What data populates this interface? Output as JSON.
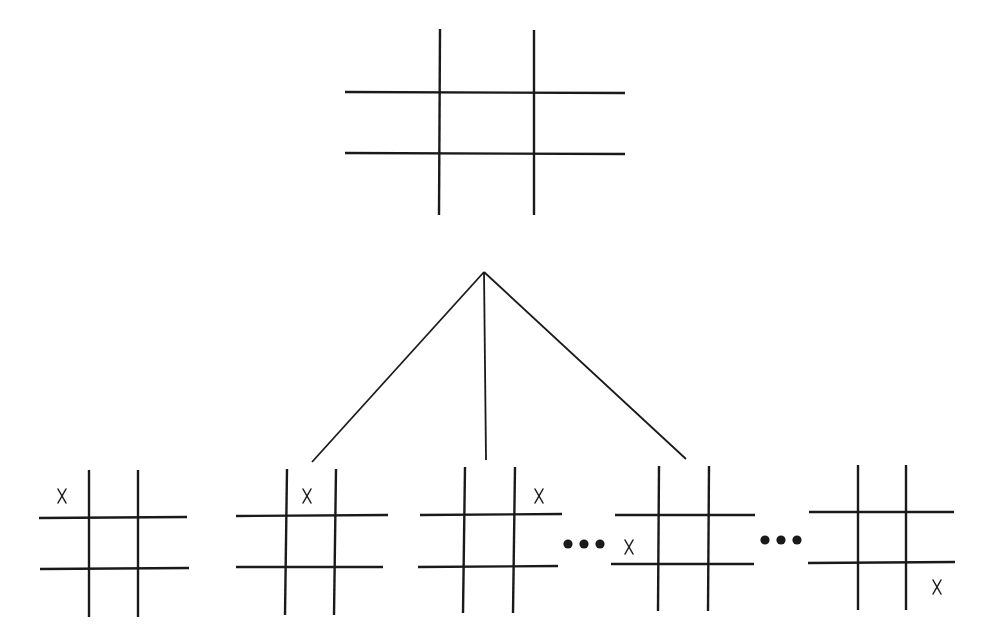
{
  "title": "Tic-tac-toe game tree: first move by X",
  "root": {
    "name": "empty-board",
    "vlines": [
      {
        "x1": 440,
        "y1": 29,
        "x2": 439,
        "y2": 215
      },
      {
        "x1": 534,
        "y1": 30,
        "x2": 534,
        "y2": 215
      }
    ],
    "hlines": [
      {
        "x1": 345,
        "y1": 92,
        "x2": 625,
        "y2": 93
      },
      {
        "x1": 345,
        "y1": 153,
        "x2": 625,
        "y2": 154
      }
    ],
    "marks": []
  },
  "branches": {
    "apex": {
      "x": 484,
      "y": 272
    },
    "ends": [
      {
        "x": 312,
        "y": 462
      },
      {
        "x": 486,
        "y": 460
      },
      {
        "x": 686,
        "y": 459
      }
    ]
  },
  "children": [
    {
      "name": "child-board-x-top-left",
      "cell": "top-left",
      "mark_label": "X",
      "vlines": [
        {
          "x1": 89,
          "y1": 470,
          "x2": 89,
          "y2": 617
        },
        {
          "x1": 138,
          "y1": 470,
          "x2": 138,
          "y2": 617
        }
      ],
      "hlines": [
        {
          "x1": 39,
          "y1": 518,
          "x2": 187,
          "y2": 517
        },
        {
          "x1": 40,
          "y1": 569,
          "x2": 189,
          "y2": 568
        }
      ],
      "marks": [
        {
          "label": "X",
          "x": 62,
          "y": 496
        }
      ]
    },
    {
      "name": "child-board-x-top-middle",
      "cell": "top-middle",
      "mark_label": "X",
      "vlines": [
        {
          "x1": 287,
          "y1": 469,
          "x2": 285,
          "y2": 615
        },
        {
          "x1": 336,
          "y1": 469,
          "x2": 334,
          "y2": 615
        }
      ],
      "hlines": [
        {
          "x1": 236,
          "y1": 516,
          "x2": 388,
          "y2": 515
        },
        {
          "x1": 236,
          "y1": 567,
          "x2": 383,
          "y2": 567
        }
      ],
      "marks": [
        {
          "label": "X",
          "x": 307,
          "y": 496
        }
      ]
    },
    {
      "name": "child-board-x-top-right",
      "cell": "top-right",
      "mark_label": "X",
      "vlines": [
        {
          "x1": 465,
          "y1": 467,
          "x2": 463,
          "y2": 613
        },
        {
          "x1": 515,
          "y1": 467,
          "x2": 513,
          "y2": 613
        }
      ],
      "hlines": [
        {
          "x1": 420,
          "y1": 515,
          "x2": 562,
          "y2": 514
        },
        {
          "x1": 418,
          "y1": 567,
          "x2": 558,
          "y2": 566
        }
      ],
      "marks": [
        {
          "label": "X",
          "x": 539,
          "y": 496
        }
      ]
    },
    {
      "name": "child-board-x-middle-left",
      "cell": "middle-left",
      "mark_label": "X",
      "vlines": [
        {
          "x1": 659,
          "y1": 466,
          "x2": 658,
          "y2": 611
        },
        {
          "x1": 709,
          "y1": 466,
          "x2": 708,
          "y2": 611
        }
      ],
      "hlines": [
        {
          "x1": 615,
          "y1": 515,
          "x2": 755,
          "y2": 515
        },
        {
          "x1": 611,
          "y1": 564,
          "x2": 754,
          "y2": 564
        }
      ],
      "marks": [
        {
          "label": "X",
          "x": 629,
          "y": 547
        }
      ]
    },
    {
      "name": "child-board-x-bottom-right",
      "cell": "bottom-right",
      "mark_label": "X",
      "vlines": [
        {
          "x1": 858,
          "y1": 465,
          "x2": 858,
          "y2": 610
        },
        {
          "x1": 906,
          "y1": 465,
          "x2": 906,
          "y2": 610
        }
      ],
      "hlines": [
        {
          "x1": 809,
          "y1": 512,
          "x2": 954,
          "y2": 512
        },
        {
          "x1": 808,
          "y1": 563,
          "x2": 955,
          "y2": 562
        }
      ],
      "marks": [
        {
          "label": "X",
          "x": 937,
          "y": 587
        }
      ]
    }
  ],
  "ellipses": [
    {
      "name": "ellipsis-1",
      "text": "•••",
      "dots": [
        {
          "x": 568,
          "y": 544
        },
        {
          "x": 584,
          "y": 544
        },
        {
          "x": 600,
          "y": 544
        }
      ]
    },
    {
      "name": "ellipsis-2",
      "text": "•••",
      "dots": [
        {
          "x": 765,
          "y": 540
        },
        {
          "x": 781,
          "y": 540
        },
        {
          "x": 797,
          "y": 540
        }
      ]
    }
  ]
}
